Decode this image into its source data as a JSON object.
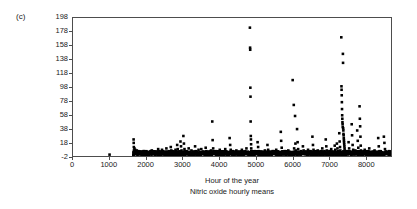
{
  "panel": {
    "label": "(c)"
  },
  "chart_data": {
    "type": "scatter",
    "title": "",
    "xlabel": "Hour of the year",
    "sublabel": "Nitric oxide hourly means",
    "ylabel": "SO2 concentration/ppb",
    "ylabel_prefix": "SO",
    "ylabel_sub": "2",
    "ylabel_suffix": " concentration/ppb",
    "xlim": [
      0,
      8700
    ],
    "ylim": [
      -2,
      198
    ],
    "xticks": [
      0,
      1000,
      2000,
      3000,
      4000,
      5000,
      6000,
      7000,
      8000
    ],
    "xtick_labels": [
      "0",
      "1000",
      "2000",
      "3000",
      "4000",
      "5000",
      "6000",
      "7000",
      "8000"
    ],
    "yticks": [
      -2,
      18,
      38,
      58,
      78,
      98,
      118,
      138,
      158,
      178,
      198
    ],
    "ytick_labels": [
      "-2",
      "18",
      "38",
      "58",
      "78",
      "98",
      "118",
      "138",
      "158",
      "178",
      "198"
    ],
    "grid": false,
    "legend": null,
    "marker": "square",
    "marker_size_px": 2.6,
    "marker_color": "#000000",
    "frame_color": "#4d4d4d",
    "background": "#ffffff",
    "points": [
      [
        1000,
        0
      ],
      [
        1655,
        3
      ],
      [
        1658,
        22
      ],
      [
        1661,
        17
      ],
      [
        1664,
        11
      ],
      [
        1667,
        6
      ],
      [
        1670,
        4
      ],
      [
        1673,
        2
      ],
      [
        1680,
        9
      ],
      [
        1686,
        5
      ],
      [
        1692,
        3
      ],
      [
        1700,
        7
      ],
      [
        1710,
        2
      ],
      [
        1720,
        4
      ],
      [
        1730,
        1
      ],
      [
        1745,
        6
      ],
      [
        1760,
        3
      ],
      [
        1775,
        2
      ],
      [
        1790,
        5
      ],
      [
        1805,
        1
      ],
      [
        1820,
        3
      ],
      [
        1835,
        2
      ],
      [
        1850,
        4
      ],
      [
        1870,
        1
      ],
      [
        1890,
        3
      ],
      [
        1910,
        2
      ],
      [
        1930,
        5
      ],
      [
        1950,
        1
      ],
      [
        1970,
        2
      ],
      [
        1990,
        3
      ],
      [
        2010,
        1
      ],
      [
        2030,
        4
      ],
      [
        2055,
        2
      ],
      [
        2080,
        1
      ],
      [
        2105,
        3
      ],
      [
        2130,
        2
      ],
      [
        2155,
        6
      ],
      [
        2180,
        2
      ],
      [
        2205,
        1
      ],
      [
        2230,
        4
      ],
      [
        2255,
        2
      ],
      [
        2280,
        1
      ],
      [
        2305,
        3
      ],
      [
        2330,
        8
      ],
      [
        2345,
        5
      ],
      [
        2360,
        2
      ],
      [
        2385,
        1
      ],
      [
        2410,
        3
      ],
      [
        2435,
        7
      ],
      [
        2455,
        2
      ],
      [
        2480,
        1
      ],
      [
        2505,
        4
      ],
      [
        2530,
        2
      ],
      [
        2555,
        9
      ],
      [
        2575,
        3
      ],
      [
        2600,
        1
      ],
      [
        2625,
        5
      ],
      [
        2650,
        2
      ],
      [
        2675,
        11
      ],
      [
        2690,
        6
      ],
      [
        2705,
        2
      ],
      [
        2730,
        1
      ],
      [
        2755,
        4
      ],
      [
        2780,
        2
      ],
      [
        2805,
        7
      ],
      [
        2825,
        3
      ],
      [
        2850,
        14
      ],
      [
        2865,
        8
      ],
      [
        2880,
        4
      ],
      [
        2900,
        2
      ],
      [
        2920,
        1
      ],
      [
        2940,
        19
      ],
      [
        2955,
        12
      ],
      [
        2970,
        6
      ],
      [
        2985,
        3
      ],
      [
        3000,
        2
      ],
      [
        3020,
        27
      ],
      [
        3035,
        16
      ],
      [
        3050,
        8
      ],
      [
        3065,
        4
      ],
      [
        3080,
        2
      ],
      [
        3100,
        5
      ],
      [
        3120,
        2
      ],
      [
        3140,
        1
      ],
      [
        3165,
        9
      ],
      [
        3190,
        3
      ],
      [
        3215,
        2
      ],
      [
        3240,
        6
      ],
      [
        3265,
        1
      ],
      [
        3290,
        4
      ],
      [
        3315,
        2
      ],
      [
        3340,
        12
      ],
      [
        3360,
        5
      ],
      [
        3385,
        2
      ],
      [
        3410,
        1
      ],
      [
        3435,
        7
      ],
      [
        3460,
        3
      ],
      [
        3485,
        2
      ],
      [
        3510,
        8
      ],
      [
        3530,
        4
      ],
      [
        3555,
        1
      ],
      [
        3580,
        3
      ],
      [
        3605,
        2
      ],
      [
        3630,
        10
      ],
      [
        3650,
        5
      ],
      [
        3675,
        2
      ],
      [
        3700,
        1
      ],
      [
        3725,
        4
      ],
      [
        3750,
        2
      ],
      [
        3775,
        6
      ],
      [
        3795,
        3
      ],
      [
        3810,
        48
      ],
      [
        3820,
        21
      ],
      [
        3835,
        9
      ],
      [
        3850,
        4
      ],
      [
        3865,
        2
      ],
      [
        3890,
        1
      ],
      [
        3915,
        5
      ],
      [
        3940,
        2
      ],
      [
        3965,
        3
      ],
      [
        3990,
        1
      ],
      [
        4015,
        7
      ],
      [
        4040,
        2
      ],
      [
        4065,
        4
      ],
      [
        4090,
        1
      ],
      [
        4115,
        3
      ],
      [
        4140,
        2
      ],
      [
        4165,
        8
      ],
      [
        4185,
        4
      ],
      [
        4210,
        1
      ],
      [
        4235,
        3
      ],
      [
        4260,
        2
      ],
      [
        4285,
        24
      ],
      [
        4300,
        14
      ],
      [
        4315,
        7
      ],
      [
        4330,
        3
      ],
      [
        4345,
        1
      ],
      [
        4370,
        5
      ],
      [
        4395,
        2
      ],
      [
        4420,
        3
      ],
      [
        4445,
        1
      ],
      [
        4470,
        6
      ],
      [
        4495,
        2
      ],
      [
        4520,
        4
      ],
      [
        4545,
        1
      ],
      [
        4570,
        3
      ],
      [
        4595,
        2
      ],
      [
        4620,
        7
      ],
      [
        4645,
        3
      ],
      [
        4670,
        1
      ],
      [
        4695,
        4
      ],
      [
        4720,
        2
      ],
      [
        4745,
        9
      ],
      [
        4765,
        3
      ],
      [
        4790,
        1
      ],
      [
        4820,
        2
      ],
      [
        4840,
        184
      ],
      [
        4845,
        155
      ],
      [
        4848,
        152
      ],
      [
        4852,
        97
      ],
      [
        4856,
        84
      ],
      [
        4860,
        48
      ],
      [
        4864,
        27
      ],
      [
        4868,
        22
      ],
      [
        4872,
        15
      ],
      [
        4876,
        9
      ],
      [
        4880,
        5
      ],
      [
        4885,
        2
      ],
      [
        4900,
        1
      ],
      [
        4925,
        3
      ],
      [
        4950,
        2
      ],
      [
        4975,
        5
      ],
      [
        5000,
        1
      ],
      [
        5025,
        3
      ],
      [
        5050,
        18
      ],
      [
        5065,
        11
      ],
      [
        5080,
        5
      ],
      [
        5100,
        2
      ],
      [
        5125,
        1
      ],
      [
        5150,
        4
      ],
      [
        5175,
        2
      ],
      [
        5200,
        3
      ],
      [
        5225,
        1
      ],
      [
        5250,
        6
      ],
      [
        5275,
        2
      ],
      [
        5300,
        4
      ],
      [
        5320,
        14
      ],
      [
        5340,
        7
      ],
      [
        5360,
        2
      ],
      [
        5385,
        1
      ],
      [
        5410,
        3
      ],
      [
        5435,
        2
      ],
      [
        5460,
        5
      ],
      [
        5485,
        1
      ],
      [
        5510,
        3
      ],
      [
        5535,
        2
      ],
      [
        5560,
        7
      ],
      [
        5585,
        3
      ],
      [
        5610,
        1
      ],
      [
        5635,
        4
      ],
      [
        5660,
        2
      ],
      [
        5685,
        33
      ],
      [
        5695,
        20
      ],
      [
        5710,
        10
      ],
      [
        5725,
        4
      ],
      [
        5740,
        2
      ],
      [
        5765,
        1
      ],
      [
        5790,
        5
      ],
      [
        5815,
        2
      ],
      [
        5840,
        3
      ],
      [
        5865,
        1
      ],
      [
        5890,
        6
      ],
      [
        5915,
        2
      ],
      [
        5940,
        4
      ],
      [
        5965,
        1
      ],
      [
        5990,
        3
      ],
      [
        6010,
        108
      ],
      [
        6020,
        2
      ],
      [
        6040,
        72
      ],
      [
        6050,
        9
      ],
      [
        6060,
        4
      ],
      [
        6075,
        56
      ],
      [
        6085,
        16
      ],
      [
        6095,
        6
      ],
      [
        6110,
        3
      ],
      [
        6130,
        37
      ],
      [
        6145,
        18
      ],
      [
        6160,
        8
      ],
      [
        6175,
        4
      ],
      [
        6190,
        2
      ],
      [
        6215,
        1
      ],
      [
        6240,
        5
      ],
      [
        6265,
        2
      ],
      [
        6290,
        12
      ],
      [
        6310,
        6
      ],
      [
        6330,
        3
      ],
      [
        6355,
        1
      ],
      [
        6380,
        4
      ],
      [
        6405,
        2
      ],
      [
        6430,
        7
      ],
      [
        6450,
        3
      ],
      [
        6475,
        1
      ],
      [
        6500,
        5
      ],
      [
        6525,
        2
      ],
      [
        6550,
        26
      ],
      [
        6565,
        14
      ],
      [
        6580,
        7
      ],
      [
        6600,
        3
      ],
      [
        6620,
        1
      ],
      [
        6645,
        4
      ],
      [
        6670,
        2
      ],
      [
        6695,
        6
      ],
      [
        6720,
        3
      ],
      [
        6745,
        1
      ],
      [
        6770,
        5
      ],
      [
        6795,
        2
      ],
      [
        6820,
        9
      ],
      [
        6840,
        4
      ],
      [
        6865,
        2
      ],
      [
        6890,
        1
      ],
      [
        6915,
        22
      ],
      [
        6930,
        12
      ],
      [
        6945,
        6
      ],
      [
        6965,
        3
      ],
      [
        6990,
        1
      ],
      [
        7015,
        5
      ],
      [
        7040,
        2
      ],
      [
        7065,
        8
      ],
      [
        7085,
        4
      ],
      [
        7110,
        2
      ],
      [
        7135,
        1
      ],
      [
        7160,
        13
      ],
      [
        7175,
        7
      ],
      [
        7195,
        3
      ],
      [
        7220,
        16
      ],
      [
        7235,
        9
      ],
      [
        7250,
        5
      ],
      [
        7265,
        2
      ],
      [
        7285,
        31
      ],
      [
        7295,
        19
      ],
      [
        7305,
        11
      ],
      [
        7315,
        6
      ],
      [
        7325,
        3
      ],
      [
        7340,
        170
      ],
      [
        7345,
        99
      ],
      [
        7348,
        94
      ],
      [
        7352,
        86
      ],
      [
        7356,
        76
      ],
      [
        7360,
        66
      ],
      [
        7364,
        57
      ],
      [
        7368,
        52
      ],
      [
        7372,
        47
      ],
      [
        7376,
        44
      ],
      [
        7380,
        40
      ],
      [
        7384,
        146
      ],
      [
        7388,
        133
      ],
      [
        7392,
        38
      ],
      [
        7396,
        35
      ],
      [
        7400,
        30
      ],
      [
        7404,
        28
      ],
      [
        7408,
        24
      ],
      [
        7412,
        21
      ],
      [
        7416,
        18
      ],
      [
        7420,
        15
      ],
      [
        7425,
        12
      ],
      [
        7430,
        9
      ],
      [
        7435,
        6
      ],
      [
        7440,
        4
      ],
      [
        7450,
        2
      ],
      [
        7465,
        1
      ],
      [
        7490,
        5
      ],
      [
        7515,
        2
      ],
      [
        7540,
        18
      ],
      [
        7555,
        9
      ],
      [
        7575,
        4
      ],
      [
        7600,
        2
      ],
      [
        7625,
        44
      ],
      [
        7635,
        28
      ],
      [
        7650,
        14
      ],
      [
        7665,
        7
      ],
      [
        7680,
        3
      ],
      [
        7700,
        1
      ],
      [
        7725,
        6
      ],
      [
        7750,
        2
      ],
      [
        7775,
        35
      ],
      [
        7790,
        20
      ],
      [
        7805,
        10
      ],
      [
        7820,
        5
      ],
      [
        7840,
        70
      ],
      [
        7848,
        52
      ],
      [
        7856,
        41
      ],
      [
        7864,
        26
      ],
      [
        7872,
        13
      ],
      [
        7880,
        6
      ],
      [
        7890,
        3
      ],
      [
        7905,
        1
      ],
      [
        7930,
        4
      ],
      [
        7955,
        2
      ],
      [
        7980,
        7
      ],
      [
        8005,
        3
      ],
      [
        8030,
        1
      ],
      [
        8055,
        5
      ],
      [
        8080,
        2
      ],
      [
        8105,
        9
      ],
      [
        8125,
        4
      ],
      [
        8150,
        2
      ],
      [
        8175,
        1
      ],
      [
        8200,
        3
      ],
      [
        8225,
        2
      ],
      [
        8250,
        6
      ],
      [
        8275,
        1
      ],
      [
        8300,
        4
      ],
      [
        8325,
        2
      ],
      [
        8350,
        24
      ],
      [
        8365,
        12
      ],
      [
        8385,
        5
      ],
      [
        8405,
        2
      ],
      [
        8430,
        1
      ],
      [
        8455,
        3
      ],
      [
        8480,
        2
      ],
      [
        8505,
        26
      ],
      [
        8520,
        17
      ],
      [
        8535,
        8
      ],
      [
        8550,
        4
      ],
      [
        8565,
        2
      ],
      [
        8585,
        1
      ],
      [
        8605,
        3
      ],
      [
        8625,
        2
      ],
      [
        8645,
        5
      ],
      [
        8660,
        1
      ],
      [
        8680,
        2
      ]
    ]
  }
}
